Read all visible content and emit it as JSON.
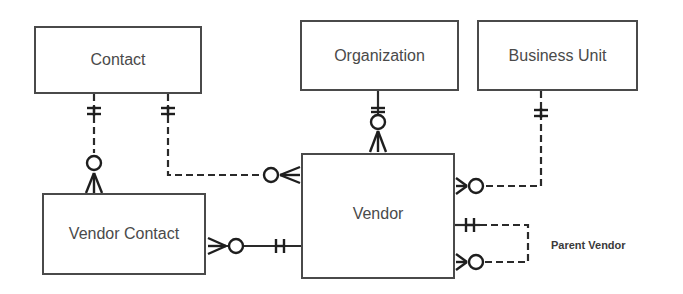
{
  "diagram": {
    "type": "entity-relationship",
    "notation": "crows-foot",
    "entities": [
      {
        "id": "contact",
        "label": "Contact"
      },
      {
        "id": "organization",
        "label": "Organization"
      },
      {
        "id": "business_unit",
        "label": "Business Unit"
      },
      {
        "id": "vendor_contact",
        "label": "Vendor Contact"
      },
      {
        "id": "vendor",
        "label": "Vendor"
      }
    ],
    "relationships": [
      {
        "from": "contact",
        "to": "vendor_contact",
        "from_cardinality": "exactly-one",
        "to_cardinality": "zero-or-many",
        "line": "dashed"
      },
      {
        "from": "contact",
        "to": "vendor",
        "from_cardinality": "exactly-one",
        "to_cardinality": "zero-or-many",
        "line": "dashed"
      },
      {
        "from": "organization",
        "to": "vendor",
        "from_cardinality": "exactly-one",
        "to_cardinality": "zero-or-many",
        "line": "solid"
      },
      {
        "from": "business_unit",
        "to": "vendor",
        "from_cardinality": "exactly-one",
        "to_cardinality": "zero-or-many",
        "line": "dashed"
      },
      {
        "from": "vendor",
        "to": "vendor_contact",
        "from_cardinality": "exactly-one",
        "to_cardinality": "zero-or-many",
        "line": "solid"
      },
      {
        "from": "vendor",
        "to": "vendor",
        "from_cardinality": "exactly-one",
        "to_cardinality": "zero-or-many",
        "line": "dashed",
        "label": "Parent Vendor"
      }
    ],
    "annotations": {
      "parent_vendor": "Parent Vendor"
    }
  },
  "colors": {
    "border": "#4a4a4a",
    "line": "#2a2a2a",
    "text": "#4a4a4a",
    "background": "#ffffff"
  }
}
